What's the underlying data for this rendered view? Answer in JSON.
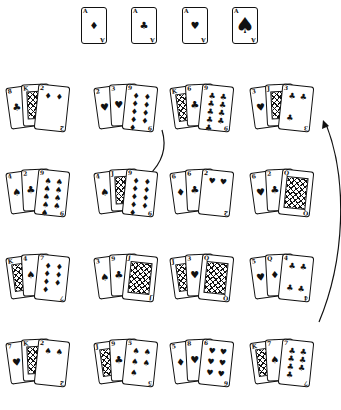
{
  "figure": {
    "ink_color": "#111111",
    "background": "#ffffff"
  },
  "aces": [
    {
      "rank": "A",
      "suit": "diamonds",
      "glyph": "♦"
    },
    {
      "rank": "A",
      "suit": "clubs",
      "glyph": "♣"
    },
    {
      "rank": "A",
      "suit": "hearts",
      "glyph": "♥"
    },
    {
      "rank": "A",
      "suit": "spades",
      "glyph": "♠"
    }
  ],
  "rows": [
    {
      "groups": [
        {
          "cards": [
            {
              "rank": "8",
              "glyph": "♣",
              "face": false
            },
            {
              "rank": "K",
              "glyph": "♣",
              "face": true
            },
            {
              "rank": "2",
              "glyph": "♦",
              "face": false
            }
          ]
        },
        {
          "cards": [
            {
              "rank": "2",
              "glyph": "♥",
              "face": false
            },
            {
              "rank": "3",
              "glyph": "♥",
              "face": false
            },
            {
              "rank": "9",
              "glyph": "♦",
              "face": false
            }
          ]
        },
        {
          "cards": [
            {
              "rank": "K",
              "glyph": "♠",
              "face": true
            },
            {
              "rank": "6",
              "glyph": "♣",
              "face": false
            },
            {
              "rank": "9",
              "glyph": "♣",
              "face": false
            }
          ]
        },
        {
          "cards": [
            {
              "rank": "3",
              "glyph": "♥",
              "face": false
            },
            {
              "rank": "J",
              "glyph": "♠",
              "face": true
            },
            {
              "rank": "3",
              "glyph": "♣",
              "face": false
            }
          ]
        }
      ]
    },
    {
      "groups": [
        {
          "cards": [
            {
              "rank": "4",
              "glyph": "♠",
              "face": false
            },
            {
              "rank": "2",
              "glyph": "♣",
              "face": false
            },
            {
              "rank": "9",
              "glyph": "♠",
              "face": false
            }
          ]
        },
        {
          "cards": [
            {
              "rank": "4",
              "glyph": "♠",
              "face": false
            },
            {
              "rank": "J",
              "glyph": "♦",
              "face": true
            },
            {
              "rank": "9",
              "glyph": "♦",
              "face": false
            }
          ]
        },
        {
          "cards": [
            {
              "rank": "6",
              "glyph": "♦",
              "face": false
            },
            {
              "rank": "6",
              "glyph": "♣",
              "face": false
            },
            {
              "rank": "2",
              "glyph": "♥",
              "face": false
            }
          ]
        },
        {
          "cards": [
            {
              "rank": "6",
              "glyph": "♥",
              "face": false
            },
            {
              "rank": "2",
              "glyph": "♣",
              "face": false
            },
            {
              "rank": "Q",
              "glyph": "♠",
              "face": true
            }
          ]
        }
      ]
    },
    {
      "groups": [
        {
          "cards": [
            {
              "rank": "K",
              "glyph": "♠",
              "face": true
            },
            {
              "rank": "4",
              "glyph": "♠",
              "face": false
            },
            {
              "rank": "7",
              "glyph": "♦",
              "face": false
            }
          ]
        },
        {
          "cards": [
            {
              "rank": "3",
              "glyph": "♠",
              "face": false
            },
            {
              "rank": "9",
              "glyph": "♣",
              "face": false
            },
            {
              "rank": "J",
              "glyph": "♣",
              "face": true
            }
          ]
        },
        {
          "cards": [
            {
              "rank": "J",
              "glyph": "♣",
              "face": true
            },
            {
              "rank": "3",
              "glyph": "♥",
              "face": false
            },
            {
              "rank": "Q",
              "glyph": "♣",
              "face": true
            }
          ]
        },
        {
          "cards": [
            {
              "rank": "5",
              "glyph": "♥",
              "face": false
            },
            {
              "rank": "Q",
              "glyph": "♦",
              "face": false
            },
            {
              "rank": "4",
              "glyph": "♣",
              "face": false
            }
          ]
        }
      ]
    },
    {
      "groups": [
        {
          "cards": [
            {
              "rank": "7",
              "glyph": "♥",
              "face": false
            },
            {
              "rank": "K",
              "glyph": "♥",
              "face": true
            },
            {
              "rank": "2",
              "glyph": "♠",
              "face": false
            }
          ]
        },
        {
          "cards": [
            {
              "rank": "J",
              "glyph": "♠",
              "face": true
            },
            {
              "rank": "9",
              "glyph": "♣",
              "face": false
            },
            {
              "rank": "5",
              "glyph": "♠",
              "face": false
            }
          ]
        },
        {
          "cards": [
            {
              "rank": "5",
              "glyph": "♦",
              "face": false
            },
            {
              "rank": "8",
              "glyph": "♥",
              "face": false
            },
            {
              "rank": "6",
              "glyph": "♥",
              "face": false
            }
          ]
        },
        {
          "cards": [
            {
              "rank": "K",
              "glyph": "♣",
              "face": true
            },
            {
              "rank": "7",
              "glyph": "♠",
              "face": false
            },
            {
              "rank": "7",
              "glyph": "♣",
              "face": false
            }
          ]
        }
      ]
    }
  ],
  "arrows": [
    {
      "from": "row1-group2 (9♦)",
      "to": "row2-group2 (9♦)"
    },
    {
      "from": "row3-group4",
      "to": "row1-group4"
    }
  ]
}
